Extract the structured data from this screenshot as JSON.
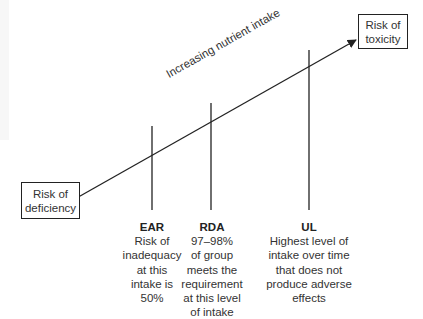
{
  "diagram": {
    "arrow_label": "Increasing nutrient intake",
    "boxes": {
      "toxicity": {
        "line1": "Risk of",
        "line2": "toxicity"
      },
      "deficiency": {
        "line1": "Risk of",
        "line2": "deficiency"
      }
    },
    "markers": [
      {
        "name": "EAR",
        "lines": [
          "Risk of",
          "inadequacy",
          "at this",
          "intake is",
          "50%"
        ]
      },
      {
        "name": "RDA",
        "lines": [
          "97–98%",
          "of group",
          "meets the",
          "requirement",
          "at this level",
          "of intake"
        ]
      },
      {
        "name": "UL",
        "lines": [
          "Highest level of",
          "intake over time",
          "that does not",
          "produce adverse",
          "effects"
        ]
      }
    ],
    "colors": {
      "line": "#222222",
      "text": "#333333",
      "background": "#ffffff"
    }
  }
}
